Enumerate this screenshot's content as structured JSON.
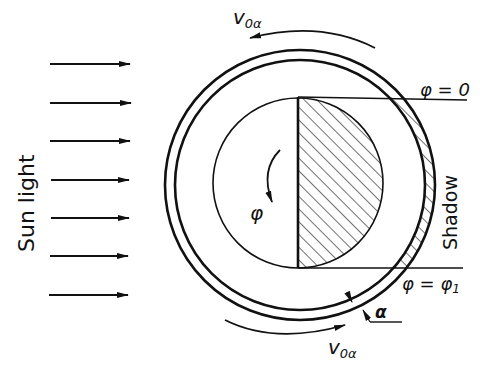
{
  "labels": {
    "sun_light": "Sun light",
    "shadow": "Shadow",
    "velocity_top": "v",
    "velocity_top_sub": "0α",
    "velocity_bottom": "v",
    "velocity_bottom_sub": "0α",
    "phi_zero": "φ = 0",
    "phi_one": "φ = φ",
    "phi_one_sub": "1",
    "phi_rotation": "φ",
    "alpha": "α"
  },
  "colors": {
    "stroke": "#111111",
    "background": "#ffffff"
  },
  "arrows": {
    "count": 7,
    "y_positions": [
      64,
      103,
      141,
      180,
      218,
      256,
      295
    ]
  }
}
